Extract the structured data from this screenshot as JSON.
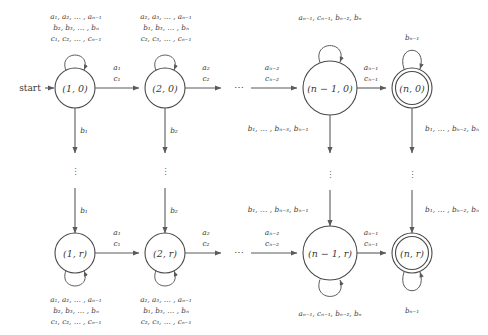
{
  "diagram": {
    "start_label": "start",
    "ellipsis_horizontal": "⋯",
    "ellipsis_vertical": "⋮",
    "colors": {
      "stroke": "#4a4a4a",
      "edge": "#5a5a5a",
      "text": "#3a3a3a",
      "background": "#ffffff"
    },
    "states": [
      {
        "id": "s10",
        "label": "(1, 0)",
        "accepting": false,
        "cx": 75,
        "cy": 88
      },
      {
        "id": "s20",
        "label": "(2, 0)",
        "accepting": false,
        "cx": 165,
        "cy": 88
      },
      {
        "id": "sn10",
        "label": "(n − 1, 0)",
        "accepting": false,
        "cx": 330,
        "cy": 88
      },
      {
        "id": "sn0",
        "label": "(n, 0)",
        "accepting": true,
        "cx": 412,
        "cy": 88
      },
      {
        "id": "s1r",
        "label": "(1, r)",
        "accepting": false,
        "cx": 75,
        "cy": 253
      },
      {
        "id": "s2r",
        "label": "(2, r)",
        "accepting": false,
        "cx": 165,
        "cy": 253
      },
      {
        "id": "sn1r",
        "label": "(n − 1, r)",
        "accepting": false,
        "cx": 330,
        "cy": 253
      },
      {
        "id": "snr",
        "label": "(n, r)",
        "accepting": true,
        "cx": 412,
        "cy": 253
      }
    ],
    "self_loops": [
      {
        "id": "loop-1-0",
        "state": "s10",
        "position": "top",
        "lines": [
          "a₁, a₂, … , aₙ₋₁",
          "b₂, b₃, … , bₙ",
          "c₁, c₂, … , cₙ₋₁"
        ]
      },
      {
        "id": "loop-2-0",
        "state": "s20",
        "position": "top",
        "lines": [
          "a₂, a₃, … , aₙ₋₁",
          "b₁, b₃, … , bₙ",
          "c₂, c₃, … , cₙ₋₁"
        ]
      },
      {
        "id": "loop-n-1-0",
        "state": "sn10",
        "position": "top",
        "lines": [
          "aₙ₋₁, cₙ₋₁, bₙ₋₂, bₙ"
        ]
      },
      {
        "id": "loop-n-0",
        "state": "sn0",
        "position": "top",
        "lines": [
          "bₙ₋₁"
        ]
      },
      {
        "id": "loop-1-r",
        "state": "s1r",
        "position": "bottom",
        "lines": [
          "a₁, a₂, … , aₙ₋₁",
          "b₂, b₃, … , bₙ",
          "c₁, c₂, … , cₙ₋₁"
        ]
      },
      {
        "id": "loop-2-r",
        "state": "s2r",
        "position": "bottom",
        "lines": [
          "a₂, a₃, … , aₙ₋₁",
          "b₁, b₃, … , bₙ",
          "c₂, c₃, … , cₙ₋₁"
        ]
      },
      {
        "id": "loop-n-1-r",
        "state": "sn1r",
        "position": "bottom",
        "lines": [
          "aₙ₋₁, cₙ₋₁, bₙ₋₂, bₙ"
        ]
      },
      {
        "id": "loop-n-r",
        "state": "snr",
        "position": "bottom",
        "lines": [
          "bₙ₋₁"
        ]
      }
    ],
    "transitions": [
      {
        "id": "t-10-20",
        "from": "s10",
        "to": "s20",
        "lines": [
          "a₁",
          "c₁"
        ]
      },
      {
        "id": "t-20-dots",
        "from": "s20",
        "to": "dots",
        "lines": [
          "a₂",
          "c₂"
        ]
      },
      {
        "id": "t-dots-n10",
        "from": "dots",
        "to": "sn10",
        "lines": [
          "aₙ₋₂",
          "cₙ₋₂"
        ]
      },
      {
        "id": "t-n10-n0",
        "from": "sn10",
        "to": "sn0",
        "lines": [
          "aₙ₋₁",
          "cₙ₋₁"
        ]
      },
      {
        "id": "t-1r-2r",
        "from": "s1r",
        "to": "s2r",
        "lines": [
          "a₁",
          "c₁"
        ]
      },
      {
        "id": "t-2r-dots",
        "from": "s2r",
        "to": "dots",
        "lines": [
          "a₂",
          "c₂"
        ]
      },
      {
        "id": "t-dots-n1r",
        "from": "dots",
        "to": "sn1r",
        "lines": [
          "aₙ₋₂",
          "cₙ₋₂"
        ]
      },
      {
        "id": "t-n1r-nr",
        "from": "sn1r",
        "to": "snr",
        "lines": [
          "aₙ₋₁",
          "cₙ₋₁"
        ]
      }
    ],
    "vertical_transitions": [
      {
        "id": "v-1",
        "column": 1,
        "label_top": "b₁",
        "label_bottom": "b₁"
      },
      {
        "id": "v-2",
        "column": 2,
        "label_top": "b₂",
        "label_bottom": "b₂"
      },
      {
        "id": "v-3",
        "column": 3,
        "label_top": "b₁, … , bₙ₋₃, bₙ₋₁",
        "label_bottom": "b₁, … , bₙ₋₃, bₙ₋₁"
      },
      {
        "id": "v-4",
        "column": 4,
        "label_top": "b₁, … , bₙ₋₂, bₙ",
        "label_bottom": "b₁, … , bₙ₋₂, bₙ"
      }
    ]
  }
}
